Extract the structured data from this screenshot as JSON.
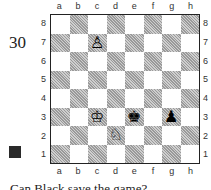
{
  "diagram": {
    "number": "30",
    "side_to_move": "black",
    "side_to_move_icon": "black-square-icon",
    "files": [
      "a",
      "b",
      "c",
      "d",
      "e",
      "f",
      "g",
      "h"
    ],
    "ranks": [
      "8",
      "7",
      "6",
      "5",
      "4",
      "3",
      "2",
      "1"
    ],
    "pieces": [
      {
        "square": "c7",
        "piece": "white-pawn",
        "glyph": "♙"
      },
      {
        "square": "c3",
        "piece": "white-king",
        "glyph": "♔"
      },
      {
        "square": "e3",
        "piece": "black-king",
        "glyph": "♚"
      },
      {
        "square": "g3",
        "piece": "black-pawn",
        "glyph": "♟"
      },
      {
        "square": "d2",
        "piece": "white-knight",
        "glyph": "♘"
      }
    ],
    "caption": "Can Black save the game?"
  }
}
